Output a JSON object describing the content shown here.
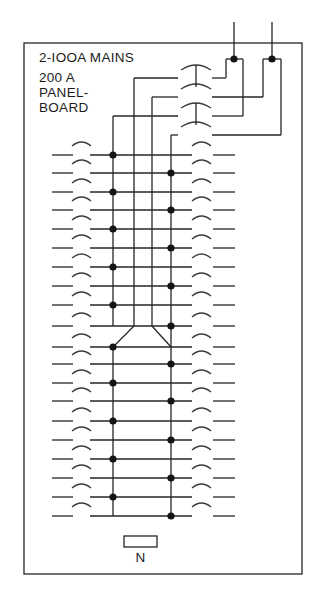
{
  "diagram": {
    "title": "2-IOOA MAINS",
    "subtitle_lines": [
      "200 A",
      "PANEL-",
      "BOARD"
    ],
    "neutral_label": "N",
    "colors": {
      "ink": "#262626",
      "background": "#ffffff"
    },
    "enclosure": {
      "x": 24,
      "y": 43,
      "w": 278,
      "h": 531
    },
    "feeds": [
      {
        "x": 234,
        "y_top": 22,
        "tap_y": 59,
        "left_x": 226,
        "right_x": 243
      },
      {
        "x": 272,
        "y_top": 22,
        "tap_y": 59,
        "left_x": 263,
        "right_x": 281
      }
    ],
    "main_breakers": [
      {
        "y": 78,
        "bus_x": 134,
        "feed_x": 226
      },
      {
        "y": 97,
        "bus_x": 152,
        "feed_x": 263
      },
      {
        "y": 116,
        "bus_x": 113,
        "feed_x": 243
      },
      {
        "y": 135,
        "bus_x": 171,
        "feed_x": 281
      }
    ],
    "main_breaker_ties": [
      [
        0,
        1
      ],
      [
        2,
        3
      ]
    ],
    "bus": {
      "phase_a_x": 113,
      "phase_b_x": 171,
      "inner_a_x": 134,
      "inner_b_x": 152,
      "merge_top_y": 326,
      "merge_bottom_y": 347,
      "bottom_y": 516
    },
    "branch_rows": [
      {
        "y": 155,
        "tap": "A"
      },
      {
        "y": 173,
        "tap": "B"
      },
      {
        "y": 192,
        "tap": "A"
      },
      {
        "y": 210,
        "tap": "B"
      },
      {
        "y": 229,
        "tap": "A"
      },
      {
        "y": 248,
        "tap": "B"
      },
      {
        "y": 267,
        "tap": "A"
      },
      {
        "y": 286,
        "tap": "B"
      },
      {
        "y": 305,
        "tap": "A"
      },
      {
        "y": 326,
        "tap": "B"
      },
      {
        "y": 347,
        "tap": "A"
      },
      {
        "y": 364,
        "tap": "B"
      },
      {
        "y": 383,
        "tap": "A"
      },
      {
        "y": 401,
        "tap": "B"
      },
      {
        "y": 421,
        "tap": "A"
      },
      {
        "y": 440,
        "tap": "B"
      },
      {
        "y": 459,
        "tap": "A"
      },
      {
        "y": 478,
        "tap": "B"
      },
      {
        "y": 497,
        "tap": "A"
      },
      {
        "y": 516,
        "tap": "B"
      }
    ],
    "neutral_bar": {
      "x": 124,
      "y": 536,
      "w": 33,
      "h": 11
    }
  }
}
